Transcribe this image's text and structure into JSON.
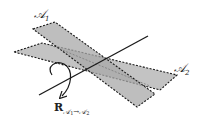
{
  "diagram": {
    "planes": [
      {
        "name": "A1",
        "label": "𝒜",
        "subscript": "1",
        "fill": "#b3b3b3"
      },
      {
        "name": "A2",
        "label": "𝒜",
        "subscript": "2",
        "fill": "#b3b3b3"
      }
    ],
    "axis": {
      "color": "#1a1a1a"
    },
    "rotation": {
      "label": "R",
      "subscript_a": "𝒜",
      "subscript_a_idx": "1",
      "arrow": "→",
      "subscript_b": "𝒜",
      "subscript_b_idx": "2"
    }
  }
}
